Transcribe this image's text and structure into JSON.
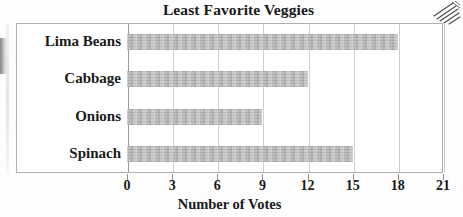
{
  "chart_data": {
    "type": "bar",
    "orientation": "horizontal",
    "title": "Least Favorite Veggies",
    "xlabel": "Number of Votes",
    "ylabel": "",
    "categories": [
      "Lima Beans",
      "Cabbage",
      "Onions",
      "Spinach"
    ],
    "values": [
      18,
      12,
      9,
      15
    ],
    "xticks": [
      "0",
      "3",
      "6",
      "9",
      "12",
      "15",
      "18",
      "21"
    ],
    "xtick_values": [
      0,
      3,
      6,
      9,
      12,
      15,
      18,
      21
    ],
    "xlim": [
      0,
      21
    ],
    "grid": true,
    "legend": null,
    "bar_color": "#b6b6b6",
    "frame_color": "#b0b0b0",
    "gridline_color": "#cfcfcf"
  },
  "artifacts": {
    "hatch_marks": "scan-hatch-marks",
    "left_edge_fragment": "cropped-glyph-fragment"
  }
}
